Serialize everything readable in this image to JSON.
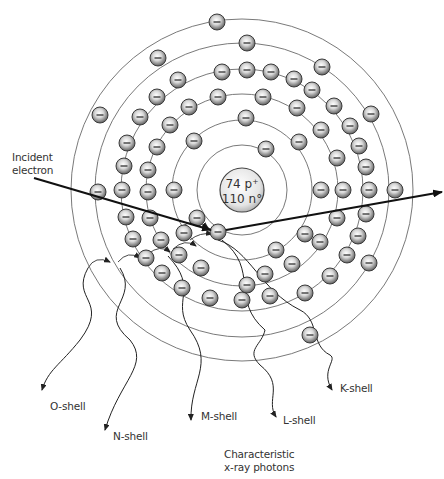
{
  "diagram": {
    "nucleus": {
      "line1": "74 p⁺",
      "line2": "110 n°",
      "cx": 242,
      "cy": 190,
      "r": 22
    },
    "center": {
      "x": 242,
      "y": 190
    },
    "orbits": [
      {
        "name": "K",
        "r": 45
      },
      {
        "name": "L",
        "r": 70
      },
      {
        "name": "M",
        "r": 96
      },
      {
        "name": "N",
        "r": 121
      },
      {
        "name": "O",
        "r": 147
      },
      {
        "name": "P",
        "r": 171
      }
    ],
    "electron_symbol": "−",
    "electron_radius": 8,
    "electrons": [
      [
        217,
        22
      ],
      [
        247,
        43
      ],
      [
        322,
        67
      ],
      [
        371,
        114
      ],
      [
        395,
        190
      ],
      [
        369,
        263
      ],
      [
        158,
        58
      ],
      [
        100,
        115
      ],
      [
        98,
        192
      ],
      [
        310,
        335
      ],
      [
        222,
        72
      ],
      [
        247,
        70
      ],
      [
        271,
        72
      ],
      [
        294,
        79
      ],
      [
        312,
        90
      ],
      [
        334,
        106
      ],
      [
        350,
        126
      ],
      [
        359,
        146
      ],
      [
        366,
        167
      ],
      [
        369,
        190
      ],
      [
        366,
        214
      ],
      [
        358,
        236
      ],
      [
        347,
        255
      ],
      [
        330,
        276
      ],
      [
        305,
        293
      ],
      [
        178,
        80
      ],
      [
        157,
        97
      ],
      [
        140,
        117
      ],
      [
        127,
        143
      ],
      [
        124,
        166
      ],
      [
        122,
        190
      ],
      [
        126,
        217
      ],
      [
        133,
        239
      ],
      [
        146,
        258
      ],
      [
        162,
        273
      ],
      [
        182,
        288
      ],
      [
        210,
        298
      ],
      [
        242,
        300
      ],
      [
        270,
        296
      ],
      [
        263,
        97
      ],
      [
        297,
        108
      ],
      [
        321,
        130
      ],
      [
        337,
        158
      ],
      [
        343,
        190
      ],
      [
        337,
        218
      ],
      [
        320,
        242
      ],
      [
        292,
        264
      ],
      [
        265,
        274
      ],
      [
        218,
        97
      ],
      [
        189,
        107
      ],
      [
        170,
        125
      ],
      [
        157,
        147
      ],
      [
        148,
        170
      ],
      [
        148,
        192
      ],
      [
        150,
        218
      ],
      [
        161,
        240
      ],
      [
        179,
        255
      ],
      [
        201,
        268
      ],
      [
        247,
        285
      ],
      [
        246,
        118
      ],
      [
        194,
        141
      ],
      [
        299,
        142
      ],
      [
        174,
        190
      ],
      [
        321,
        190
      ],
      [
        305,
        234
      ],
      [
        276,
        250
      ],
      [
        218,
        232
      ],
      [
        184,
        233
      ],
      [
        266,
        149
      ],
      [
        197,
        218
      ]
    ],
    "incident_electron": {
      "label_line1": "Incident",
      "label_line2": "electron",
      "from": [
        34,
        178
      ],
      "to": [
        211,
        230
      ]
    },
    "scattered_electron": {
      "from": [
        226,
        230
      ],
      "to": [
        442,
        192
      ]
    },
    "photon_labels": [
      {
        "text": "O-shell",
        "x": 50,
        "y": 400
      },
      {
        "text": "N-shell",
        "x": 113,
        "y": 430
      },
      {
        "text": "M-shell",
        "x": 201,
        "y": 410
      },
      {
        "text": "L-shell",
        "x": 283,
        "y": 414
      },
      {
        "text": "K-shell",
        "x": 340,
        "y": 382
      }
    ],
    "caption_line1": "Characteristic",
    "caption_line2": "x-ray photons",
    "colors": {
      "orbit": "#6a6a6a",
      "electron_fill_light": "#f2f2f2",
      "electron_fill_dark": "#6e6e6e",
      "electron_stroke": "#3a3a3a",
      "arrow": "#111111"
    }
  }
}
